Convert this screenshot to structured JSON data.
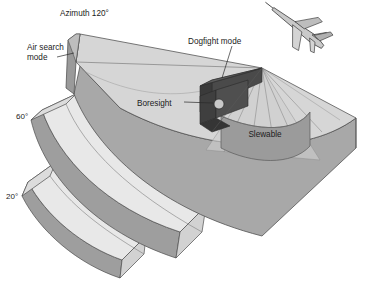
{
  "figure": {
    "title_text": "Radar scan volume modes",
    "background_color": "#ffffff"
  },
  "labels": {
    "azimuth": "Azimuth 120°",
    "air_search_line1": "Air search",
    "air_search_line2": "mode",
    "dogfight": "Dogfight mode",
    "boresight": "Boresight",
    "slewable": "Slewable",
    "elevation_60": "60°",
    "elevation_20": "20°"
  },
  "icons": {
    "aircraft": "fighter-jet-icon",
    "boresight_node": "boresight-cylinder-icon"
  },
  "colors": {
    "sector_top_light": "#d6d6d6",
    "sector_top_pale": "#e3e3e3",
    "sector_side_mid": "#a8a8a8",
    "sector_side_dark": "#9a9a9a",
    "band_top": "#e8e8e8",
    "band_face": "#9e9e9e",
    "antenna_dark": "#4a4a4a",
    "antenna_darker": "#3a3a3a",
    "slewable_fill": "#9b9b9b",
    "beam_fill": "#cfcfcf",
    "aircraft_fill": "#c9c9c9",
    "outline": "#4d4d4d",
    "text": "#1b1b1b"
  },
  "geometry": {
    "azimuth_degrees": 120,
    "elevation_bands_degrees": [
      60,
      20
    ],
    "apex_x": 262,
    "apex_y": 68
  }
}
